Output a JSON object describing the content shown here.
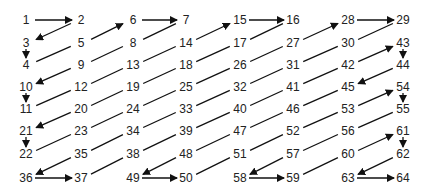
{
  "colors": {
    "line": "#111111",
    "text": "#222222",
    "background": "#ffffff"
  },
  "grid": {
    "cols": [
      26,
      81,
      133,
      186,
      240,
      293,
      348,
      403
    ],
    "rows": [
      20,
      43,
      65,
      87,
      109,
      131,
      154,
      178
    ]
  },
  "cells": [
    [
      1,
      2,
      6,
      7,
      15,
      16,
      28,
      29
    ],
    [
      3,
      5,
      8,
      14,
      17,
      27,
      30,
      43
    ],
    [
      4,
      9,
      13,
      18,
      26,
      31,
      42,
      44
    ],
    [
      10,
      12,
      19,
      25,
      32,
      41,
      45,
      54
    ],
    [
      11,
      20,
      24,
      33,
      40,
      46,
      53,
      55
    ],
    [
      21,
      23,
      34,
      39,
      47,
      52,
      56,
      61
    ],
    [
      22,
      35,
      38,
      48,
      51,
      57,
      60,
      62
    ],
    [
      36,
      37,
      49,
      50,
      58,
      59,
      63,
      64
    ]
  ],
  "arrowed_steps": [
    1,
    2,
    3,
    5,
    6,
    9,
    10,
    14,
    15,
    20,
    21,
    27,
    28,
    35,
    36,
    42,
    43,
    44,
    48,
    49,
    53,
    54,
    57,
    58,
    60,
    61,
    62,
    63
  ]
}
